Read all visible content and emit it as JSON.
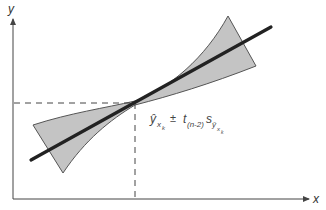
{
  "diagram": {
    "title": "",
    "axes": {
      "x_label": "x",
      "y_label": "y"
    },
    "annotation": {
      "yhat": "ŷ",
      "sub_x": "x",
      "sub_k": "k",
      "pm": "±",
      "t": "t",
      "t_sub": "(n-2)",
      "s": "s",
      "s_sub_yhat": "ŷ",
      "s_sub_x": "x",
      "s_sub_k": "k",
      "full_text": "ŷ_{x_k} ± t_{(n-2)} s_{ŷ_{x_k}}"
    },
    "colors": {
      "band_fill": "#c4c4c4",
      "band_stroke": "#555555",
      "regression_line": "#222222",
      "axes": "#444444",
      "dashed_guides": "#444444"
    },
    "elements": {
      "regression_line": {
        "description": "fitted regression line",
        "from": [
          31,
          160
        ],
        "to": [
          271,
          27
        ]
      },
      "confidence_band": {
        "description": "prediction/confidence band, narrowest at x_k, widening toward both ends"
      },
      "guide_horizontal": {
        "description": "dashed line from y-axis to point (x_k, ŷ_xk)"
      },
      "guide_vertical": {
        "description": "dashed line from x-axis up to point (x_k, ŷ_xk)"
      }
    }
  }
}
